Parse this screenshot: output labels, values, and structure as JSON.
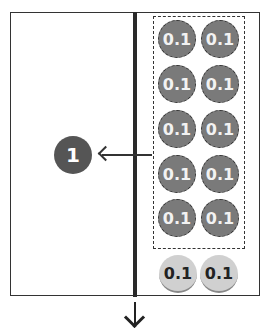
{
  "diagram": {
    "result_label": "1",
    "grouped_coins": [
      {
        "label": "0.1"
      },
      {
        "label": "0.1"
      },
      {
        "label": "0.1"
      },
      {
        "label": "0.1"
      },
      {
        "label": "0.1"
      },
      {
        "label": "0.1"
      },
      {
        "label": "0.1"
      },
      {
        "label": "0.1"
      },
      {
        "label": "0.1"
      },
      {
        "label": "0.1"
      }
    ],
    "remaining_coins": [
      {
        "label": "0.1"
      },
      {
        "label": "0.1"
      }
    ],
    "colors": {
      "grouped_coin": "#7a7a7a",
      "remaining_coin": "#d0d0d0",
      "result": "#555555"
    }
  }
}
